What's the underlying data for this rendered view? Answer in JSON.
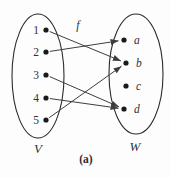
{
  "figure": {
    "caption": "(a)",
    "function_label": "f",
    "colors": {
      "background": "#fdfdfd",
      "line": "#3d3d3d",
      "ellipse": "#2b2b2b",
      "dot": "#1a1a1a",
      "text": "#333333"
    },
    "left_set": {
      "label": "V",
      "ellipse": {
        "cx": 38,
        "cy": 76,
        "rx": 26,
        "ry": 62
      },
      "element_style": "normal",
      "label_side": "left",
      "elements": [
        {
          "name": "1",
          "x": 46,
          "y": 30
        },
        {
          "name": "2",
          "x": 46,
          "y": 52
        },
        {
          "name": "3",
          "x": 46,
          "y": 75
        },
        {
          "name": "4",
          "x": 46,
          "y": 98
        },
        {
          "name": "5",
          "x": 46,
          "y": 120
        }
      ]
    },
    "right_set": {
      "label": "W",
      "ellipse": {
        "cx": 136,
        "cy": 74,
        "rx": 27,
        "ry": 60
      },
      "element_style": "italic",
      "label_side": "right",
      "elements": [
        {
          "name": "a",
          "x": 124,
          "y": 40
        },
        {
          "name": "b",
          "x": 126,
          "y": 63
        },
        {
          "name": "c",
          "x": 126,
          "y": 86
        },
        {
          "name": "d",
          "x": 124,
          "y": 109
        }
      ]
    },
    "mappings": [
      {
        "from": "1",
        "to": "b"
      },
      {
        "from": "2",
        "to": "a"
      },
      {
        "from": "3",
        "to": "d"
      },
      {
        "from": "4",
        "to": "d"
      },
      {
        "from": "5",
        "to": "b"
      }
    ]
  }
}
